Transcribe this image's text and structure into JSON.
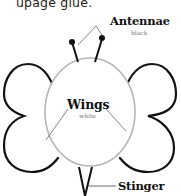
{
  "caption": {
    "text": "upage glue."
  },
  "labels": {
    "antennae": {
      "title": "Antennae",
      "color_note": "black"
    },
    "wings": {
      "title": "Wings",
      "color_note": "white"
    },
    "stinger": {
      "title": "Stinger"
    }
  },
  "colors": {
    "outline": "#111111",
    "body": "#b5b5b5",
    "leader": "#666666",
    "background": "#ffffff"
  }
}
